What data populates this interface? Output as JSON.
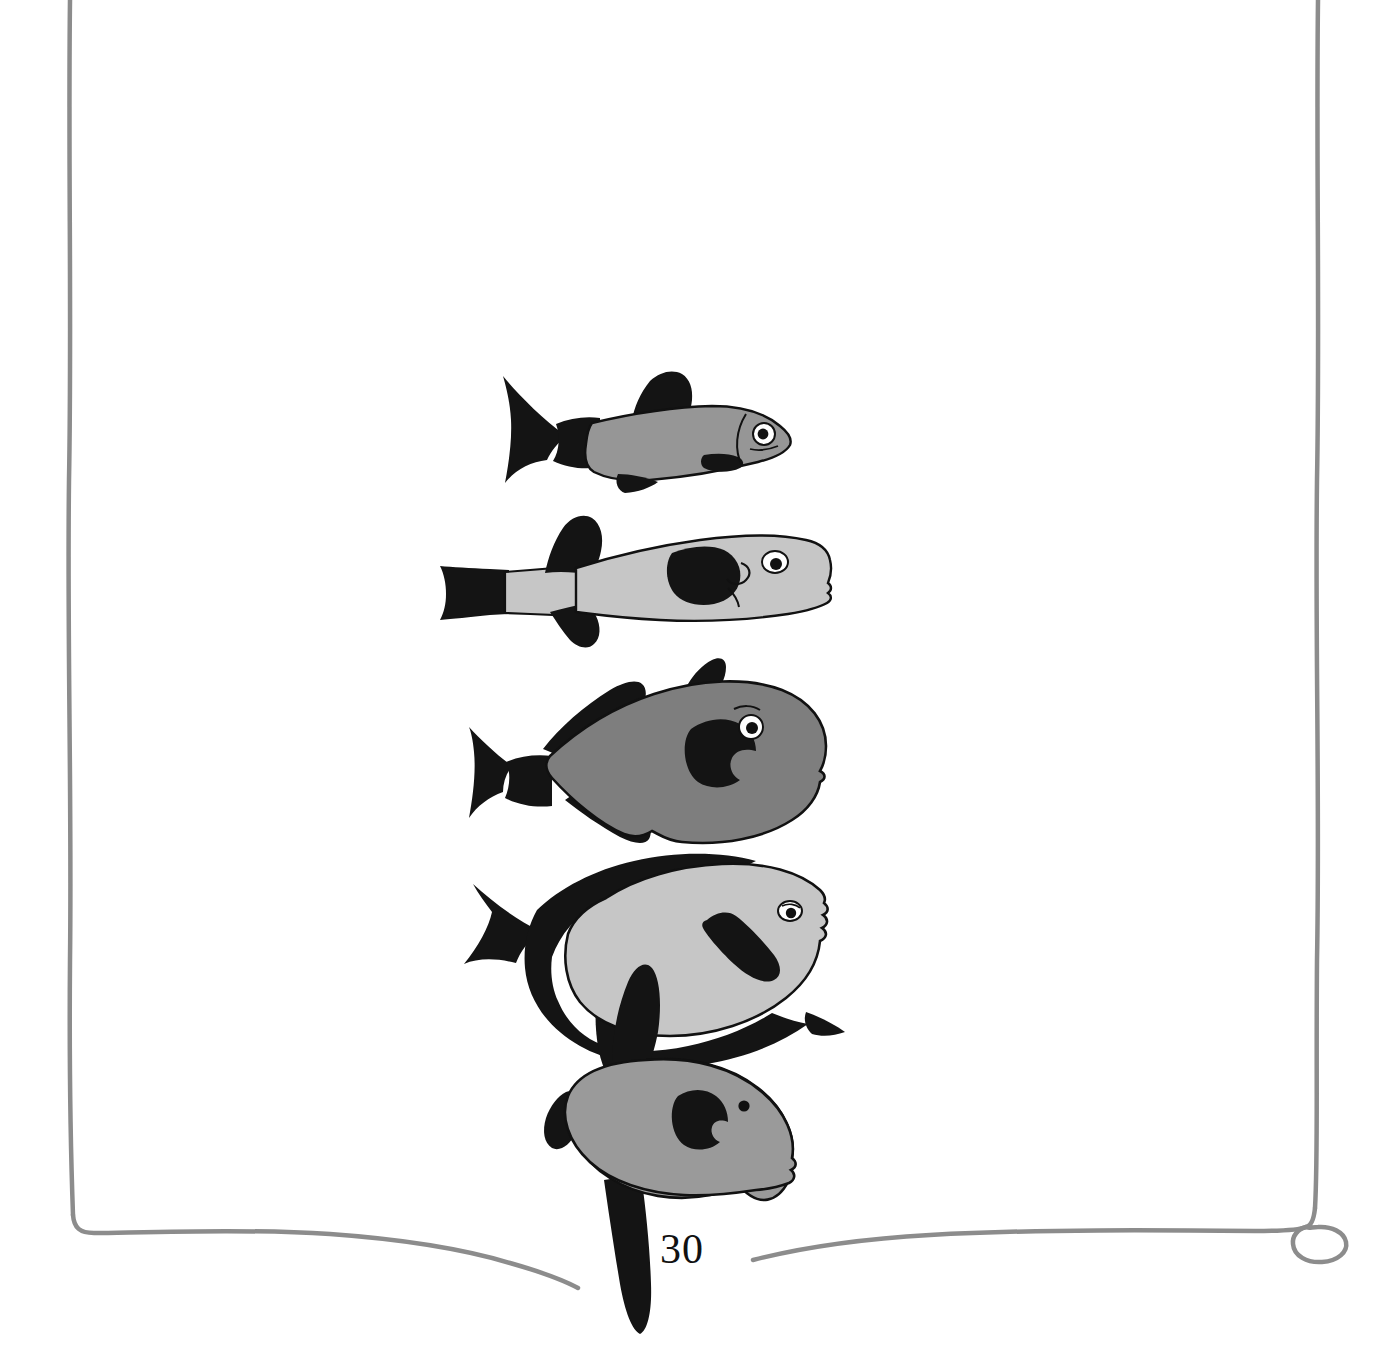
{
  "page": {
    "number_label": "30",
    "background_color": "#ffffff",
    "width": 1394,
    "height": 1352
  },
  "frame": {
    "name": "hand-drawn-page-border",
    "stroke_color": "#8c8c8c",
    "stroke_width": 4,
    "sides": [
      "left",
      "right",
      "bottom"
    ],
    "corner_detail_bottom_right": "loop-curl",
    "bottom_gap_for_fish_tail": true
  },
  "illustration": {
    "title": "fish-body-shape-series",
    "style": "black-and-white-grayscale-line-drawing",
    "colors": {
      "outline": "#111111",
      "fin_black": "#141414",
      "body_mid_gray": "#969696",
      "body_light_gray": "#c6c6c6",
      "body_dark_gray": "#7e7e7e",
      "body_round_gray": "#9a9a9a",
      "eye_white": "#ffffff",
      "eye_pupil": "#111111"
    },
    "fish": [
      {
        "id": "fish-1",
        "name": "elongate-streamlined-fish",
        "body_fill": "#969696",
        "fin_fill": "#141414",
        "order": 1
      },
      {
        "id": "fish-2",
        "name": "elongate-blunt-tail-fish",
        "body_fill": "#c6c6c6",
        "fin_fill": "#141414",
        "order": 2
      },
      {
        "id": "fish-3",
        "name": "oval-deep-bodied-fish",
        "body_fill": "#7e7e7e",
        "fin_fill": "#141414",
        "order": 3
      },
      {
        "id": "fish-4",
        "name": "disc-shaped-surgeonfish",
        "body_fill": "#c6c6c6",
        "fin_fill": "#141414",
        "order": 4
      },
      {
        "id": "fish-5",
        "name": "round-sunfish-mola",
        "body_fill": "#9a9a9a",
        "fin_fill": "#141414",
        "order": 5
      }
    ]
  }
}
